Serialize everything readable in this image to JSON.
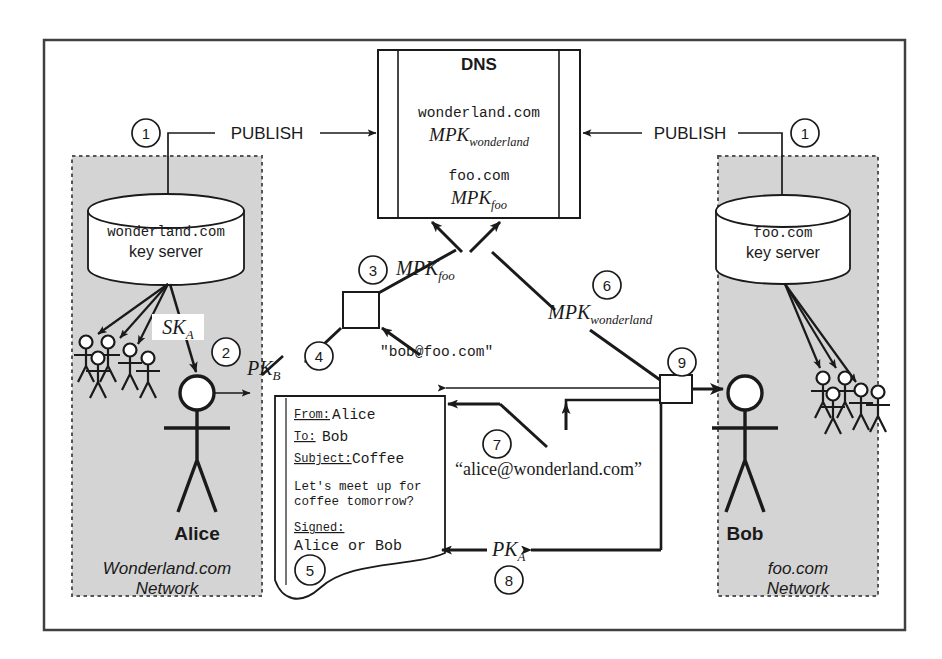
{
  "figure": {
    "colors": {
      "ink": "#1a1a1a",
      "network_fill": "#d4d4d4",
      "network_border": "#555555",
      "paper": "#ffffff"
    }
  },
  "dns": {
    "title": "DNS",
    "entries": [
      {
        "domain": "wonderland.com",
        "key": "MPK",
        "key_sub": "wonderland"
      },
      {
        "domain": "foo.com",
        "key": "MPK",
        "key_sub": "foo"
      }
    ]
  },
  "publish": {
    "left_label": "PUBLISH",
    "right_label": "PUBLISH",
    "left_step": "1",
    "right_step": "1"
  },
  "left_network": {
    "server_domain": "wonderland.com",
    "server_role": "key server",
    "network_line1": "Wonderland.com",
    "network_line2": "Network",
    "actor": "Alice",
    "key_label": "SK",
    "key_sub": "A",
    "key_step": "2",
    "crowd_count": 5
  },
  "right_network": {
    "server_domain": "foo.com",
    "server_role": "key server",
    "network_line1": "foo.com",
    "network_line2": "Network",
    "actor": "Bob",
    "crowd_count": 5
  },
  "middle": {
    "mpk_foo": {
      "key": "MPK",
      "key_sub": "foo",
      "step": "3"
    },
    "pk_b": {
      "key": "PK",
      "key_sub": "B",
      "step": "4"
    },
    "bob_address": "\"bob@foo.com\"",
    "mpk_wonderland": {
      "key": "MPK",
      "key_sub": "wonderland",
      "step": "6"
    },
    "alice_address": "“alice@wonderland.com”",
    "alice_address_step": "7",
    "pk_a": {
      "key": "PK",
      "key_sub": "A",
      "step": "8"
    },
    "decrypt_step": "9"
  },
  "email": {
    "step": "5",
    "fields": [
      {
        "label": "From:",
        "value": "Alice"
      },
      {
        "label": "To:",
        "value": "Bob"
      },
      {
        "label": "Subject:",
        "value": "Coffee"
      }
    ],
    "body_line1": "Let's meet up for",
    "body_line2": "coffee tomorrow?",
    "signed_label": "Signed:",
    "signed_value": "Alice or Bob"
  }
}
